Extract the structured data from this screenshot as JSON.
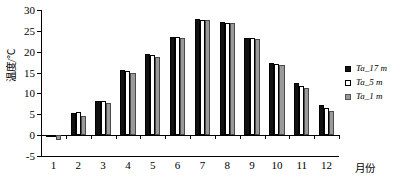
{
  "chart_data": {
    "type": "bar",
    "title": "",
    "xlabel": "月份",
    "ylabel": "温度/℃",
    "categories": [
      "1",
      "2",
      "3",
      "4",
      "5",
      "6",
      "7",
      "8",
      "9",
      "10",
      "11",
      "12"
    ],
    "series": [
      {
        "name": "Ta_17 m",
        "color": "#111111",
        "values": [
          -0.3,
          5.4,
          8.3,
          15.6,
          19.4,
          23.5,
          27.9,
          27.2,
          23.4,
          17.3,
          12.4,
          7.2
        ]
      },
      {
        "name": "Ta_5 m",
        "color": "#ffffff",
        "values": [
          -0.5,
          5.6,
          8.3,
          15.3,
          19.1,
          23.5,
          27.7,
          26.9,
          23.3,
          17.0,
          11.7,
          6.5
        ]
      },
      {
        "name": "Ta_1 m",
        "color": "#9a9a9a",
        "values": [
          -1.2,
          4.7,
          7.7,
          14.9,
          18.8,
          23.2,
          27.5,
          26.8,
          23.1,
          16.8,
          11.2,
          5.9
        ]
      }
    ],
    "ylim": [
      -5,
      30
    ],
    "y_ticks": [
      -5,
      0,
      5,
      10,
      15,
      20,
      25,
      30
    ],
    "y_tick_labels": [
      "-5",
      "0",
      "5",
      "10",
      "15",
      "20",
      "25",
      "30"
    ],
    "grid": false,
    "legend_position": "right"
  },
  "legend": {
    "items": [
      {
        "label": "Ta_17 m",
        "marker": "filled-square-marker"
      },
      {
        "label": "Ta_5 m",
        "marker": "hollow-square-marker"
      },
      {
        "label": "Ta_1 m",
        "marker": "gray-square-marker"
      }
    ]
  }
}
